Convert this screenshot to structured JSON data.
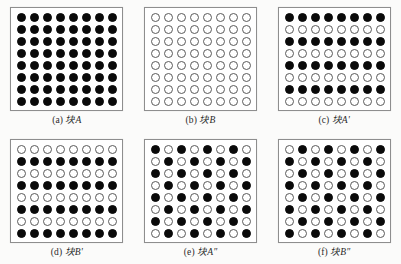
{
  "figure": {
    "background_color": "#fbfbfa",
    "panel_border_color": "#8e8e8e",
    "dot_black_color": "#0a0a0a",
    "dot_white_fill": "#ffffff",
    "dot_white_outline": "#5a5a5a",
    "rows": 8,
    "cols": 8
  },
  "panels": [
    {
      "id": "panel-a",
      "caption": "(a) 块A",
      "tag": "(a)",
      "label": "块A",
      "pattern": "all-black",
      "grid": [
        [
          1,
          1,
          1,
          1,
          1,
          1,
          1,
          1
        ],
        [
          1,
          1,
          1,
          1,
          1,
          1,
          1,
          1
        ],
        [
          1,
          1,
          1,
          1,
          1,
          1,
          1,
          1
        ],
        [
          1,
          1,
          1,
          1,
          1,
          1,
          1,
          1
        ],
        [
          1,
          1,
          1,
          1,
          1,
          1,
          1,
          1
        ],
        [
          1,
          1,
          1,
          1,
          1,
          1,
          1,
          1
        ],
        [
          1,
          1,
          1,
          1,
          1,
          1,
          1,
          1
        ],
        [
          1,
          1,
          1,
          1,
          1,
          1,
          1,
          1
        ]
      ]
    },
    {
      "id": "panel-b",
      "caption": "(b) 块B",
      "tag": "(b)",
      "label": "块B",
      "pattern": "all-white",
      "grid": [
        [
          0,
          0,
          0,
          0,
          0,
          0,
          0,
          0
        ],
        [
          0,
          0,
          0,
          0,
          0,
          0,
          0,
          0
        ],
        [
          0,
          0,
          0,
          0,
          0,
          0,
          0,
          0
        ],
        [
          0,
          0,
          0,
          0,
          0,
          0,
          0,
          0
        ],
        [
          0,
          0,
          0,
          0,
          0,
          0,
          0,
          0
        ],
        [
          0,
          0,
          0,
          0,
          0,
          0,
          0,
          0
        ],
        [
          0,
          0,
          0,
          0,
          0,
          0,
          0,
          0
        ],
        [
          0,
          0,
          0,
          0,
          0,
          0,
          0,
          0
        ]
      ]
    },
    {
      "id": "panel-c",
      "caption": "(c) 块A'",
      "tag": "(c)",
      "label": "块A'",
      "pattern": "horizontal-stripes-black-first",
      "grid": [
        [
          1,
          1,
          1,
          1,
          1,
          1,
          1,
          1
        ],
        [
          0,
          0,
          0,
          0,
          0,
          0,
          0,
          0
        ],
        [
          1,
          1,
          1,
          1,
          1,
          1,
          1,
          1
        ],
        [
          0,
          0,
          0,
          0,
          0,
          0,
          0,
          0
        ],
        [
          1,
          1,
          1,
          1,
          1,
          1,
          1,
          1
        ],
        [
          0,
          0,
          0,
          0,
          0,
          0,
          0,
          0
        ],
        [
          1,
          1,
          1,
          1,
          1,
          1,
          1,
          1
        ],
        [
          0,
          0,
          0,
          0,
          0,
          0,
          0,
          0
        ]
      ]
    },
    {
      "id": "panel-d",
      "caption": "(d) 块B'",
      "tag": "(d)",
      "label": "块B'",
      "pattern": "horizontal-stripes-white-first",
      "grid": [
        [
          0,
          0,
          0,
          0,
          0,
          0,
          0,
          0
        ],
        [
          1,
          1,
          1,
          1,
          1,
          1,
          1,
          1
        ],
        [
          0,
          0,
          0,
          0,
          0,
          0,
          0,
          0
        ],
        [
          1,
          1,
          1,
          1,
          1,
          1,
          1,
          1
        ],
        [
          0,
          0,
          0,
          0,
          0,
          0,
          0,
          0
        ],
        [
          1,
          1,
          1,
          1,
          1,
          1,
          1,
          1
        ],
        [
          0,
          0,
          0,
          0,
          0,
          0,
          0,
          0
        ],
        [
          1,
          1,
          1,
          1,
          1,
          1,
          1,
          1
        ]
      ]
    },
    {
      "id": "panel-e",
      "caption": "(e) 块A″",
      "tag": "(e)",
      "label": "块A″",
      "pattern": "checkerboard-black-first",
      "grid": [
        [
          1,
          0,
          1,
          0,
          1,
          0,
          1,
          0
        ],
        [
          0,
          1,
          0,
          1,
          0,
          1,
          0,
          1
        ],
        [
          1,
          0,
          1,
          0,
          1,
          0,
          1,
          0
        ],
        [
          0,
          1,
          0,
          1,
          0,
          1,
          0,
          1
        ],
        [
          1,
          0,
          1,
          0,
          1,
          0,
          1,
          0
        ],
        [
          0,
          1,
          0,
          1,
          0,
          1,
          0,
          1
        ],
        [
          1,
          0,
          1,
          0,
          1,
          0,
          1,
          0
        ],
        [
          0,
          1,
          0,
          1,
          0,
          1,
          0,
          1
        ]
      ]
    },
    {
      "id": "panel-f",
      "caption": "(f) 块B″",
      "tag": "(f)",
      "label": "块B″",
      "pattern": "checkerboard-white-first",
      "grid": [
        [
          0,
          1,
          0,
          1,
          0,
          1,
          0,
          1
        ],
        [
          1,
          0,
          1,
          0,
          1,
          0,
          1,
          0
        ],
        [
          0,
          1,
          0,
          1,
          0,
          1,
          0,
          1
        ],
        [
          1,
          0,
          1,
          0,
          1,
          0,
          1,
          0
        ],
        [
          0,
          1,
          0,
          1,
          0,
          1,
          0,
          1
        ],
        [
          1,
          0,
          1,
          0,
          1,
          0,
          1,
          0
        ],
        [
          0,
          1,
          0,
          1,
          0,
          1,
          0,
          1
        ],
        [
          1,
          0,
          1,
          0,
          1,
          0,
          1,
          0
        ]
      ]
    }
  ]
}
